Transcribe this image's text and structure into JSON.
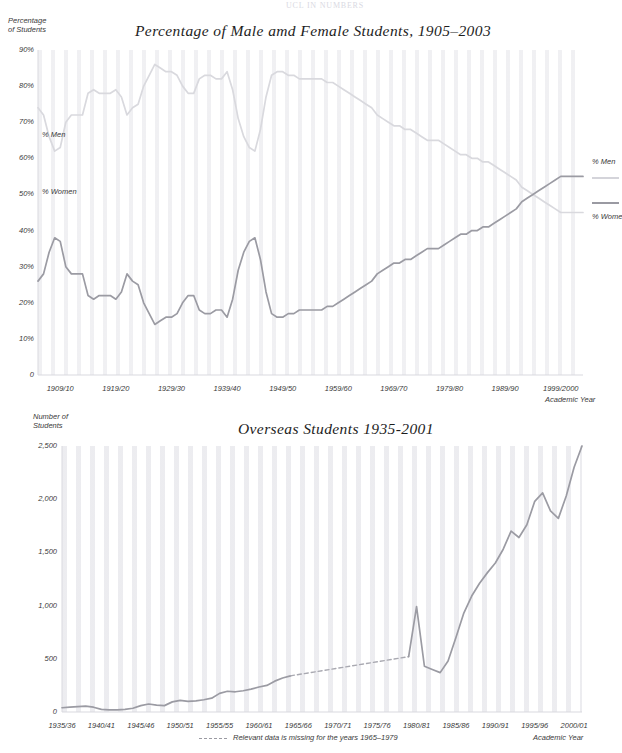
{
  "page": {
    "header_text": "UCL IN NUMBERS"
  },
  "chart_data": [
    {
      "id": "male-female-students",
      "type": "line",
      "title": "Percentage of  Male amd Female Students, 1905–2003",
      "ylabel": "Percentage\nof Students",
      "ylabel_line1": "Percentage",
      "ylabel_line2": "of Students",
      "xlabel": "Academic Year",
      "grid": false,
      "ylim": [
        0,
        90
      ],
      "yticks": [
        "90%",
        "80%",
        "70%",
        "60%",
        "50%",
        "40%",
        "30%",
        "20%",
        "10%",
        "0"
      ],
      "ytick_values": [
        90,
        80,
        70,
        60,
        50,
        40,
        30,
        20,
        10,
        0
      ],
      "xticks": [
        "1909/10",
        "1919/20",
        "1929/30",
        "1939/40",
        "1949/50",
        "1959/60",
        "1969/70",
        "1979/80",
        "1989/90",
        "1999/2000"
      ],
      "xtick_values": [
        1909,
        1919,
        1929,
        1939,
        1949,
        1959,
        1969,
        1979,
        1989,
        1999
      ],
      "xlim": [
        1905,
        2003
      ],
      "inline_labels": [
        {
          "text": "% Men",
          "x": 1908,
          "y": 56
        },
        {
          "text": "% Women",
          "x": 1908,
          "y": 43
        }
      ],
      "legend": {
        "position": "right",
        "entries": [
          {
            "name": "% Men",
            "color": "#d4d4da"
          },
          {
            "name": "% Wome",
            "color": "#9a9aa2"
          }
        ]
      },
      "series": [
        {
          "name": "% Men",
          "color": "#d9d9de",
          "x": [
            1905,
            1906,
            1907,
            1908,
            1909,
            1910,
            1911,
            1912,
            1913,
            1914,
            1915,
            1916,
            1917,
            1918,
            1919,
            1920,
            1921,
            1922,
            1923,
            1924,
            1925,
            1926,
            1927,
            1928,
            1929,
            1930,
            1931,
            1932,
            1933,
            1934,
            1935,
            1936,
            1937,
            1938,
            1939,
            1940,
            1941,
            1942,
            1943,
            1944,
            1945,
            1946,
            1947,
            1948,
            1949,
            1950,
            1951,
            1952,
            1953,
            1954,
            1955,
            1956,
            1957,
            1958,
            1959,
            1960,
            1961,
            1962,
            1963,
            1964,
            1965,
            1966,
            1967,
            1968,
            1969,
            1970,
            1971,
            1972,
            1973,
            1974,
            1975,
            1976,
            1977,
            1978,
            1979,
            1980,
            1981,
            1982,
            1983,
            1984,
            1985,
            1986,
            1987,
            1988,
            1989,
            1990,
            1991,
            1992,
            1993,
            1994,
            1995,
            1996,
            1997,
            1998,
            1999,
            2000,
            2001,
            2002,
            2003
          ],
          "values": [
            74,
            72,
            66,
            62,
            63,
            70,
            72,
            72,
            72,
            78,
            79,
            78,
            78,
            78,
            79,
            77,
            72,
            74,
            75,
            80,
            83,
            86,
            85,
            84,
            84,
            83,
            80,
            78,
            78,
            82,
            83,
            83,
            82,
            82,
            84,
            79,
            71,
            66,
            63,
            62,
            68,
            77,
            83,
            84,
            84,
            83,
            83,
            82,
            82,
            82,
            82,
            82,
            81,
            81,
            80,
            79,
            78,
            77,
            76,
            75,
            74,
            72,
            71,
            70,
            69,
            69,
            68,
            68,
            67,
            66,
            65,
            65,
            65,
            64,
            63,
            62,
            61,
            61,
            60,
            60,
            59,
            59,
            58,
            57,
            56,
            55,
            54,
            52,
            51,
            50,
            49,
            48,
            47,
            46,
            45,
            45,
            45,
            45,
            45
          ]
        },
        {
          "name": "% Women",
          "color": "#9b9ba3",
          "x": [
            1905,
            1906,
            1907,
            1908,
            1909,
            1910,
            1911,
            1912,
            1913,
            1914,
            1915,
            1916,
            1917,
            1918,
            1919,
            1920,
            1921,
            1922,
            1923,
            1924,
            1925,
            1926,
            1927,
            1928,
            1929,
            1930,
            1931,
            1932,
            1933,
            1934,
            1935,
            1936,
            1937,
            1938,
            1939,
            1940,
            1941,
            1942,
            1943,
            1944,
            1945,
            1946,
            1947,
            1948,
            1949,
            1950,
            1951,
            1952,
            1953,
            1954,
            1955,
            1956,
            1957,
            1958,
            1959,
            1960,
            1961,
            1962,
            1963,
            1964,
            1965,
            1966,
            1967,
            1968,
            1969,
            1970,
            1971,
            1972,
            1973,
            1974,
            1975,
            1976,
            1977,
            1978,
            1979,
            1980,
            1981,
            1982,
            1983,
            1984,
            1985,
            1986,
            1987,
            1988,
            1989,
            1990,
            1991,
            1992,
            1993,
            1994,
            1995,
            1996,
            1997,
            1998,
            1999,
            2000,
            2001,
            2002,
            2003
          ],
          "values": [
            26,
            28,
            34,
            38,
            37,
            30,
            28,
            28,
            28,
            22,
            21,
            22,
            22,
            22,
            21,
            23,
            28,
            26,
            25,
            20,
            17,
            14,
            15,
            16,
            16,
            17,
            20,
            22,
            22,
            18,
            17,
            17,
            18,
            18,
            16,
            21,
            29,
            34,
            37,
            38,
            32,
            23,
            17,
            16,
            16,
            17,
            17,
            18,
            18,
            18,
            18,
            18,
            19,
            19,
            20,
            21,
            22,
            23,
            24,
            25,
            26,
            28,
            29,
            30,
            31,
            31,
            32,
            32,
            33,
            34,
            35,
            35,
            35,
            36,
            37,
            38,
            39,
            39,
            40,
            40,
            41,
            41,
            42,
            43,
            44,
            45,
            46,
            48,
            49,
            50,
            51,
            52,
            53,
            54,
            55,
            55,
            55,
            55,
            55
          ]
        }
      ]
    },
    {
      "id": "overseas-students",
      "type": "line",
      "title": "Overseas Students 1935-2001",
      "ylabel_line1": "Number of",
      "ylabel_line2": "Students",
      "xlabel": "Academic Year",
      "grid": false,
      "ylim": [
        0,
        2500
      ],
      "yticks": [
        "2,500",
        "2,000",
        "1,500",
        "1,000",
        "500",
        "0"
      ],
      "ytick_values": [
        2500,
        2000,
        1500,
        1000,
        500,
        0
      ],
      "xticks": [
        "1935/36",
        "1940/41",
        "1945/46",
        "1950/51",
        "1955/55",
        "1960/61",
        "1965/66",
        "1970/71",
        "1975/76",
        "1980/81",
        "1985/86",
        "1990/91",
        "1995/96",
        "2000/01"
      ],
      "xtick_values": [
        1935,
        1940,
        1945,
        1950,
        1955,
        1960,
        1965,
        1970,
        1975,
        1980,
        1985,
        1990,
        1995,
        2000
      ],
      "xlim": [
        1935,
        2001
      ],
      "footnote": "Relevant data is missing for the years 1965–1979",
      "series": [
        {
          "name": "Overseas Students",
          "color": "#9b9ba3",
          "x": [
            1935,
            1936,
            1937,
            1938,
            1939,
            1940,
            1941,
            1942,
            1943,
            1944,
            1945,
            1946,
            1947,
            1948,
            1949,
            1950,
            1951,
            1952,
            1953,
            1954,
            1955,
            1956,
            1957,
            1958,
            1959,
            1960,
            1961,
            1962,
            1963,
            1964
          ],
          "values": [
            40,
            45,
            50,
            55,
            45,
            25,
            20,
            20,
            25,
            35,
            60,
            75,
            65,
            60,
            95,
            110,
            100,
            105,
            115,
            130,
            175,
            195,
            190,
            200,
            215,
            235,
            250,
            290,
            320,
            340
          ]
        },
        {
          "name": "Overseas Students (missing data, interpolated)",
          "color": "#a9a9b1",
          "style": "dashed",
          "x": [
            1964,
            1979
          ],
          "values": [
            340,
            520
          ]
        },
        {
          "name": "Overseas Students (post-1979)",
          "color": "#9b9ba3",
          "x": [
            1979,
            1980,
            1981,
            1982,
            1983,
            1984,
            1985,
            1986,
            1987,
            1988,
            1989,
            1990,
            1991,
            1992,
            1993,
            1994,
            1995,
            1996,
            1997,
            1998,
            1999,
            2000,
            2001
          ],
          "values": [
            520,
            990,
            430,
            400,
            370,
            480,
            700,
            930,
            1090,
            1210,
            1310,
            1400,
            1530,
            1700,
            1640,
            1760,
            1980,
            2060,
            1890,
            1820,
            2030,
            2300,
            2500
          ]
        }
      ]
    }
  ]
}
